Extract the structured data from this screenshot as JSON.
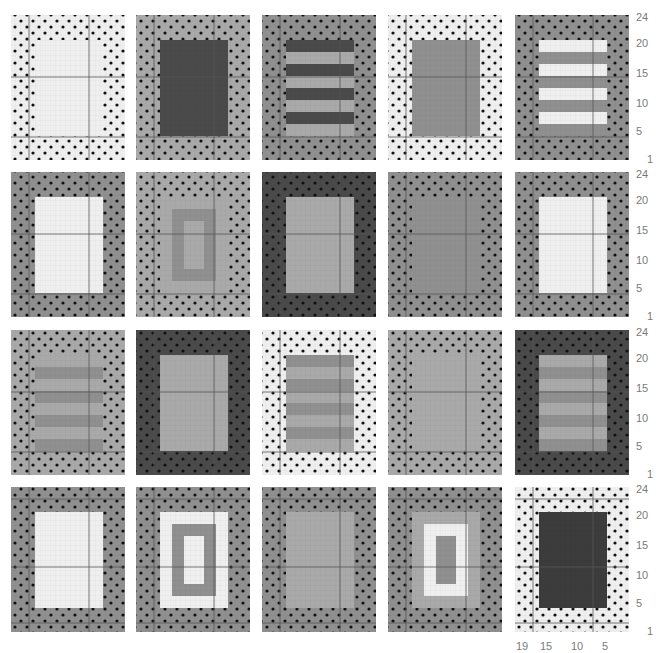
{
  "palette": {
    "white": "#efefef",
    "light": "#a9a9a9",
    "mid": "#909090",
    "dark": "#4a4a4a",
    "darker": "#3c3c3c",
    "dot": "#111111",
    "guide": "#555555"
  },
  "y_axis_labels": [
    "24",
    "20",
    "15",
    "10",
    "5",
    "1"
  ],
  "x_axis_labels": [
    "19",
    "15",
    "10",
    "5"
  ],
  "rows": [
    {
      "panels": [
        {
          "name": "panel-r1c1",
          "bg": "white",
          "inner": {
            "type": "solid",
            "fill": "white"
          }
        },
        {
          "name": "panel-r1c2",
          "bg": "light",
          "inner": {
            "type": "solid",
            "fill": "dark"
          }
        },
        {
          "name": "panel-r1c3",
          "bg": "mid",
          "inner": {
            "type": "stripes",
            "colors": [
              "dark",
              "light"
            ],
            "count": 8
          }
        },
        {
          "name": "panel-r1c4",
          "bg": "white",
          "inner": {
            "type": "solid",
            "fill": "mid"
          }
        },
        {
          "name": "panel-r1c5",
          "bg": "mid",
          "inner": {
            "type": "stripes",
            "colors": [
              "white",
              "mid"
            ],
            "count": 8
          }
        }
      ]
    },
    {
      "panels": [
        {
          "name": "panel-r2c1",
          "bg": "mid",
          "inner": {
            "type": "solid",
            "fill": "white"
          }
        },
        {
          "name": "panel-r2c2",
          "bg": "light",
          "inner": {
            "type": "nested",
            "fills": [
              "light",
              "mid",
              "light"
            ]
          }
        },
        {
          "name": "panel-r2c3",
          "bg": "dark",
          "inner": {
            "type": "solid",
            "fill": "light"
          }
        },
        {
          "name": "panel-r2c4",
          "bg": "mid",
          "inner": {
            "type": "solid",
            "fill": "mid"
          }
        },
        {
          "name": "panel-r2c5",
          "bg": "mid",
          "inner": {
            "type": "solid",
            "fill": "white"
          }
        }
      ]
    },
    {
      "panels": [
        {
          "name": "panel-r3c1",
          "bg": "light",
          "inner": {
            "type": "stripes",
            "colors": [
              "light",
              "mid"
            ],
            "count": 8
          }
        },
        {
          "name": "panel-r3c2",
          "bg": "dark",
          "inner": {
            "type": "solid",
            "fill": "light"
          }
        },
        {
          "name": "panel-r3c3",
          "bg": "white",
          "inner": {
            "type": "stripes",
            "colors": [
              "mid",
              "light"
            ],
            "count": 8
          }
        },
        {
          "name": "panel-r3c4",
          "bg": "light",
          "inner": {
            "type": "solid",
            "fill": "light"
          }
        },
        {
          "name": "panel-r3c5",
          "bg": "dark",
          "inner": {
            "type": "stripes",
            "colors": [
              "light",
              "mid"
            ],
            "count": 8
          }
        }
      ]
    },
    {
      "panels": [
        {
          "name": "panel-r4c1",
          "bg": "mid",
          "inner": {
            "type": "solid",
            "fill": "white"
          }
        },
        {
          "name": "panel-r4c2",
          "bg": "mid",
          "inner": {
            "type": "nested",
            "fills": [
              "white",
              "mid",
              "white"
            ]
          }
        },
        {
          "name": "panel-r4c3",
          "bg": "mid",
          "inner": {
            "type": "solid",
            "fill": "light"
          }
        },
        {
          "name": "panel-r4c4",
          "bg": "mid",
          "inner": {
            "type": "nested",
            "fills": [
              "light",
              "white",
              "mid"
            ]
          }
        },
        {
          "name": "panel-r4c5",
          "bg": "white",
          "inner": {
            "type": "solid",
            "fill": "darker"
          }
        }
      ]
    }
  ]
}
